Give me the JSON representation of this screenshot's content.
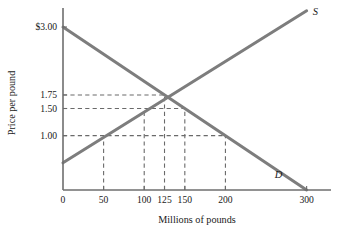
{
  "chart_data": {
    "type": "line",
    "title": "",
    "xlabel": "Millions of pounds",
    "ylabel": "Price per pound",
    "xlim": [
      0,
      330
    ],
    "ylim": [
      0,
      3.35
    ],
    "grid": false,
    "legend": "inline-curve-labels",
    "xticks": [
      {
        "value": 0,
        "label": "0"
      },
      {
        "value": 50,
        "label": "50"
      },
      {
        "value": 100,
        "label": "100"
      },
      {
        "value": 125,
        "label": "125"
      },
      {
        "value": 150,
        "label": "150"
      },
      {
        "value": 200,
        "label": "200"
      },
      {
        "value": 300,
        "label": "300"
      }
    ],
    "yticks": [
      {
        "value": 3.0,
        "label": "$3.00"
      },
      {
        "value": 1.75,
        "label": "1.75"
      },
      {
        "value": 1.5,
        "label": "1.50"
      },
      {
        "value": 1.0,
        "label": "1.00"
      }
    ],
    "series": [
      {
        "name": "Supply",
        "label": "S",
        "points": [
          [
            0,
            0.5
          ],
          [
            300,
            3.3
          ]
        ]
      },
      {
        "name": "Demand",
        "label": "D",
        "points": [
          [
            0,
            3.0
          ],
          [
            300,
            0.0
          ]
        ]
      }
    ],
    "equilibrium": {
      "quantity": 125,
      "price": 1.75
    },
    "guides": {
      "horizontal": [
        {
          "price": 1.75,
          "to_quantity": 125
        },
        {
          "price": 1.5,
          "to_quantity": 150
        },
        {
          "price": 1.0,
          "to_quantity": 200
        }
      ],
      "vertical": [
        {
          "quantity": 50,
          "to_price": 1.0
        },
        {
          "quantity": 100,
          "to_price": 1.5
        },
        {
          "quantity": 125,
          "to_price": 1.75
        },
        {
          "quantity": 150,
          "to_price": 1.5
        },
        {
          "quantity": 200,
          "to_price": 1.0
        }
      ]
    },
    "colors": {
      "curve": "#7d7d7d",
      "axis": "#6e6e6e",
      "dash": "#6a6a6a",
      "text": "#1a1a1a",
      "background": "#ffffff"
    }
  }
}
